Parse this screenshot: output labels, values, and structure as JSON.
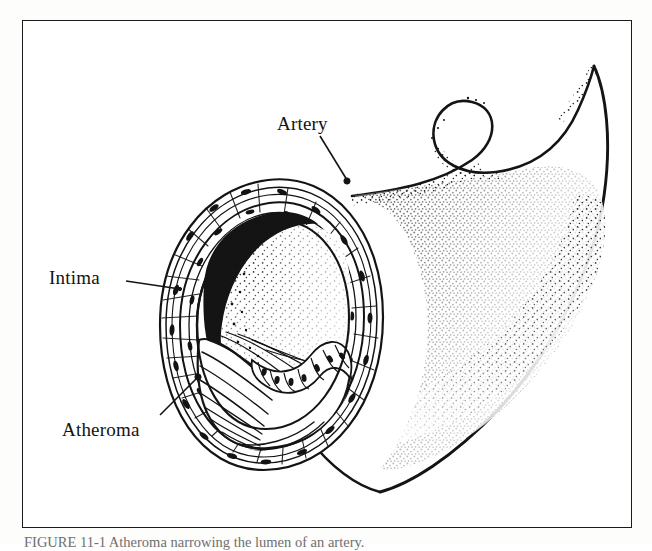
{
  "figure": {
    "caption": "FIGURE 11-1  Atheroma narrowing the lumen of an artery.",
    "frame_color": "#1b1b1b",
    "ink_color": "#111111",
    "paper_color": "#ffffff"
  },
  "labels": {
    "artery": "Artery",
    "intima": "Intima",
    "atheroma": "Atheroma"
  },
  "callouts": [
    {
      "name": "artery",
      "text": "Artery",
      "leader_from": [
        320,
        136
      ],
      "leader_to": [
        347,
        182
      ]
    },
    {
      "name": "intima",
      "text": "Intima",
      "leader_from": [
        126,
        278
      ],
      "leader_to": [
        178,
        288
      ]
    },
    {
      "name": "atheroma",
      "text": "Atheroma",
      "leader_from": [
        160,
        416
      ],
      "leader_to": [
        198,
        378
      ]
    }
  ],
  "structures": [
    {
      "name": "artery-tube",
      "description": "Longitudinal artery wall sweeping to upper right with hook-shaped free edge and stipple shading"
    },
    {
      "name": "vessel-wall",
      "description": "Concentric layered arterial wall with smooth-muscle and elastic fibre texture"
    },
    {
      "name": "lumen",
      "description": "Residual vessel lumen rendered in fine stipple"
    },
    {
      "name": "intima-band",
      "description": "Dense black thickened intimal lining at the upper-left of the lumen"
    },
    {
      "name": "atheroma-plaque",
      "description": "Fibrous atheromatous plaque with streaming fibre strands protruding into the lumen"
    },
    {
      "name": "endothelial-cells",
      "description": "Row of rounded nucleated endothelial cells capping the plaque surface"
    }
  ]
}
